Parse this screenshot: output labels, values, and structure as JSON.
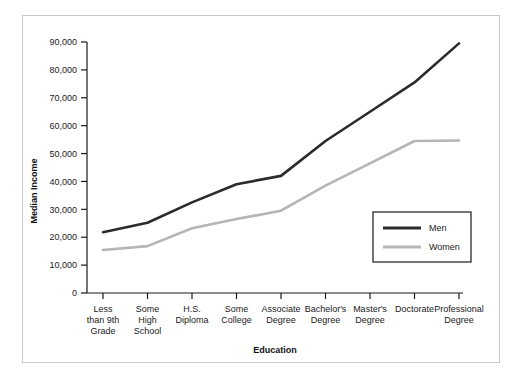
{
  "chart_data": {
    "type": "line",
    "title": "",
    "xlabel": "Education",
    "ylabel": "Median Income",
    "categories": [
      "Less than 9th Grade",
      "Some High School",
      "H.S. Diploma",
      "Some College",
      "Associate Degree",
      "Bachelor's Degree",
      "Master's Degree",
      "Doctorate",
      "Professional Degree"
    ],
    "category_lines": [
      [
        "Less",
        "than 9th",
        "Grade"
      ],
      [
        "Some",
        "High",
        "School"
      ],
      [
        "H.S.",
        "Diploma"
      ],
      [
        "Some",
        "College"
      ],
      [
        "Associate",
        "Degree"
      ],
      [
        "Bachelor's",
        "Degree"
      ],
      [
        "Master's",
        "Degree"
      ],
      [
        "Doctorate"
      ],
      [
        "Professional",
        "Degree"
      ]
    ],
    "series": [
      {
        "name": "Men",
        "color": "#2b2b2b",
        "values": [
          21800,
          25200,
          32500,
          39000,
          42000,
          54500,
          65000,
          75500,
          89500
        ]
      },
      {
        "name": "Women",
        "color": "#b5b5b5",
        "values": [
          15400,
          16800,
          23200,
          26500,
          29500,
          38500,
          46500,
          54500,
          54700
        ]
      }
    ],
    "ylim": [
      0,
      90000
    ],
    "ytick_values": [
      0,
      10000,
      20000,
      30000,
      40000,
      50000,
      60000,
      70000,
      80000,
      90000
    ],
    "ytick_labels": [
      "0",
      "10,000",
      "20,000",
      "30,000",
      "40,000",
      "50,000",
      "60,000",
      "70,000",
      "80,000",
      "90,000"
    ],
    "grid": false,
    "legend_position": "lower-right",
    "legend_entries": [
      "Men",
      "Women"
    ]
  },
  "legend": {
    "men_label": "Men",
    "women_label": "Women"
  },
  "axes": {
    "y_title": "Median Income",
    "x_title": "Education"
  }
}
